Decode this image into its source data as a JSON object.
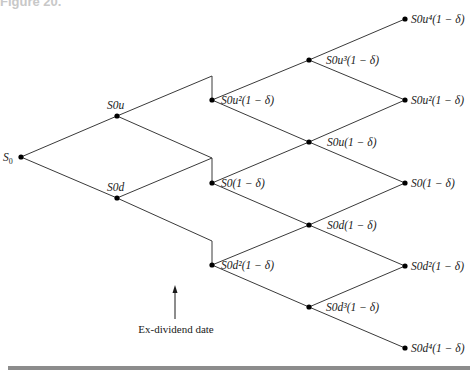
{
  "header": {
    "partial_caption": "Figure 20."
  },
  "diagram": {
    "annotation": "Ex-dividend date",
    "nodes": {
      "root": "S",
      "root_sub": "0",
      "u1": "S0u",
      "d1": "S0d",
      "c2_top": "S0u²(1 − δ)",
      "c2_mid": "S0(1 − δ)",
      "c2_bot": "S0d²(1 − δ)",
      "c3_1": "S0u³(1 − δ)",
      "c3_2": "S0u(1 − δ)",
      "c3_3": "S0d(1 − δ)",
      "c3_4": "S0d³(1 − δ)",
      "c4_1": "S0u⁴(1 − δ)",
      "c4_2": "S0u²(1 − δ)",
      "c4_3": "S0(1 − δ)",
      "c4_4": "S0d²(1 − δ)",
      "c4_5": "S0d⁴(1 − δ)"
    }
  }
}
